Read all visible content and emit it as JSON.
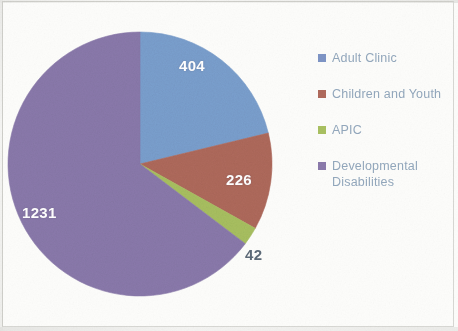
{
  "chart_data": {
    "type": "pie",
    "title": "",
    "subtitle": "",
    "xlabel": "",
    "ylabel": "",
    "categories": [
      "Adult Clinic",
      "Children and Youth",
      "APIC",
      "Developmental Disabilities"
    ],
    "values": [
      404,
      226,
      42,
      1231
    ],
    "total": 1903,
    "colors": [
      "#7ba0cf",
      "#b06a5c",
      "#a9c161",
      "#8b7aac"
    ],
    "data_labels": [
      "404",
      "226",
      "42",
      "1231"
    ],
    "data_label_position": [
      "inside",
      "inside",
      "outside",
      "inside"
    ],
    "start_angle_deg": 0,
    "direction": "clockwise",
    "legend_position": "right",
    "grid": false,
    "slices": [
      {
        "label": "Adult Clinic",
        "value": 404,
        "display": "404",
        "color": "#7ba0cf",
        "percent": 21.2,
        "start_deg": 0.0,
        "sweep_deg": 76.4,
        "label_color": "#ffffff"
      },
      {
        "label": "Children and Youth",
        "value": 226,
        "display": "226",
        "color": "#b06a5c",
        "percent": 11.9,
        "start_deg": 76.4,
        "sweep_deg": 42.8,
        "label_color": "#ffffff"
      },
      {
        "label": "APIC",
        "value": 42,
        "display": "42",
        "color": "#a9c161",
        "percent": 2.2,
        "start_deg": 119.2,
        "sweep_deg": 7.9,
        "label_color": "#5d6a78"
      },
      {
        "label": "Developmental Disabilities",
        "value": 1231,
        "display": "1231",
        "color": "#8b7aac",
        "percent": 64.7,
        "start_deg": 127.1,
        "sweep_deg": 232.9,
        "label_color": "#ffffff"
      }
    ]
  },
  "legend": {
    "items": [
      {
        "label": "Adult Clinic",
        "color": "#7e95c6"
      },
      {
        "label": "Children and Youth",
        "color": "#b06a5c"
      },
      {
        "label": "APIC",
        "color": "#a9c161"
      },
      {
        "label": "Developmental Disabilities",
        "color": "#8b7aac"
      }
    ]
  }
}
